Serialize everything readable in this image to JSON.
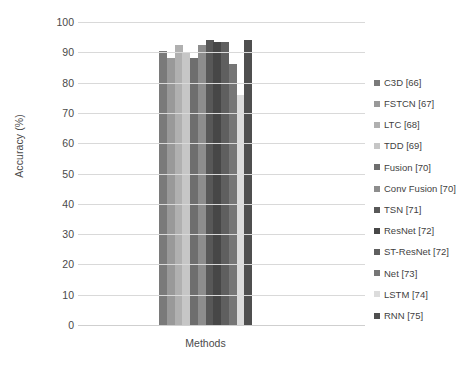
{
  "chart_data": {
    "type": "bar",
    "title": "",
    "xlabel": "Methods",
    "ylabel": "Accuracy (%)",
    "ylim": [
      0,
      100
    ],
    "ytick_labels": [
      "100",
      "90",
      "80",
      "70",
      "60",
      "50",
      "40",
      "30",
      "20",
      "10",
      "0"
    ],
    "ytick_values": [
      100,
      90,
      80,
      70,
      60,
      50,
      40,
      30,
      20,
      10,
      0
    ],
    "categories": [
      "Methods"
    ],
    "grid": true,
    "legend_position": "right",
    "series": [
      {
        "name": "C3D [66]",
        "value": 90.5,
        "color": "#7a7a7a"
      },
      {
        "name": "FSTCN [67]",
        "value": 88.0,
        "color": "#999999"
      },
      {
        "name": "LTC [68]",
        "value": 92.5,
        "color": "#b0b0b0"
      },
      {
        "name": "TDD [69]",
        "value": 90.0,
        "color": "#c6c6c6"
      },
      {
        "name": "Fusion [70]",
        "value": 88.0,
        "color": "#6e6e6e"
      },
      {
        "name": "Conv Fusion [70]",
        "value": 92.5,
        "color": "#8d8d8d"
      },
      {
        "name": "TSN [71]",
        "value": 94.0,
        "color": "#585858"
      },
      {
        "name": "ResNet [72]",
        "value": 93.5,
        "color": "#474747"
      },
      {
        "name": "ST-ResNet [72]",
        "value": 93.5,
        "color": "#5f5f5f"
      },
      {
        "name": "Net [73]",
        "value": 86.0,
        "color": "#767676"
      },
      {
        "name": "LSTM [74]",
        "value": 76.0,
        "color": "#dcdcdc"
      },
      {
        "name": "RNN [75]",
        "value": 94.0,
        "color": "#4f4f4f"
      }
    ]
  },
  "axis": {
    "y_title": "Accuracy (%)",
    "x_title": "Methods"
  },
  "colors": {
    "gridline": "#d9d9d9",
    "text": "#4a4a4a",
    "background": "#ffffff"
  }
}
